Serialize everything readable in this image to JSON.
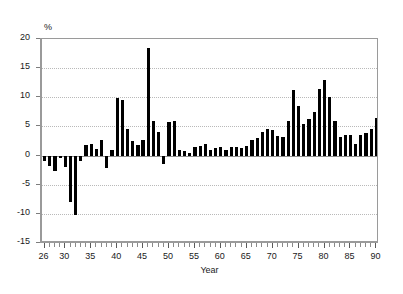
{
  "chart_data": {
    "type": "bar",
    "title": "",
    "subtitle": "",
    "xlabel": "Year",
    "ylabel": "%",
    "ylim": [
      -15,
      20
    ],
    "xlim": [
      25.5,
      90.5
    ],
    "ytick_values": [
      20,
      15,
      10,
      5,
      0,
      -5,
      -10,
      -15
    ],
    "ytick_labels": [
      "20",
      "15",
      "10",
      "5",
      "0",
      "-5",
      "-10",
      "-15"
    ],
    "xtick_values": [
      26,
      30,
      35,
      40,
      45,
      50,
      55,
      60,
      65,
      70,
      75,
      80,
      85,
      90
    ],
    "xtick_labels": [
      "26",
      "30",
      "35",
      "40",
      "45",
      "50",
      "55",
      "60",
      "65",
      "70",
      "75",
      "80",
      "85",
      "90"
    ],
    "x_minor_tick_step": 1,
    "grid": "horizontal-dotted",
    "legend": "none",
    "bar_color": "#000000",
    "series_name": "annual percent change",
    "categories": [
      26,
      27,
      28,
      29,
      30,
      31,
      32,
      33,
      34,
      35,
      36,
      37,
      38,
      39,
      40,
      41,
      42,
      43,
      44,
      45,
      46,
      47,
      48,
      49,
      50,
      51,
      52,
      53,
      54,
      55,
      56,
      57,
      58,
      59,
      60,
      61,
      62,
      63,
      64,
      65,
      66,
      67,
      68,
      69,
      70,
      71,
      72,
      73,
      74,
      75,
      76,
      77,
      78,
      79,
      80,
      81,
      82,
      83,
      84,
      85,
      86,
      87,
      88,
      89,
      90
    ],
    "values": [
      -1.0,
      -1.8,
      -2.6,
      -0.4,
      -2.0,
      -8.0,
      -10.2,
      -1.0,
      1.8,
      2.0,
      1.2,
      2.6,
      -2.2,
      1.0,
      9.9,
      9.5,
      4.5,
      2.5,
      1.8,
      2.7,
      18.5,
      6.0,
      4.0,
      -1.5,
      5.8,
      6.0,
      1.0,
      0.8,
      0.4,
      1.5,
      1.6,
      2.0,
      1.0,
      1.3,
      1.5,
      1.0,
      1.5,
      1.5,
      1.3,
      1.6,
      2.6,
      3.0,
      4.0,
      4.5,
      4.4,
      3.3,
      3.2,
      6.0,
      11.3,
      8.5,
      5.5,
      6.3,
      7.5,
      11.5,
      13.0,
      10.0,
      6.0,
      3.2,
      3.5,
      3.5,
      2.0,
      3.5,
      3.8,
      4.6,
      6.5
    ]
  }
}
